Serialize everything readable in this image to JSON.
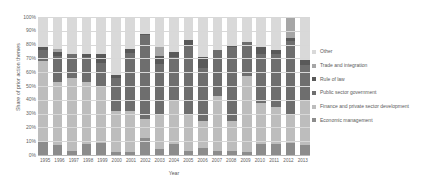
{
  "chart_data": {
    "type": "bar",
    "stacked": true,
    "normalized_percent": true,
    "title": "",
    "xlabel": "Year",
    "ylabel": "Share of prior action themes",
    "ylim": [
      0,
      100
    ],
    "ytick_labels": [
      "100%",
      "90%",
      "80%",
      "70%",
      "60%",
      "50%",
      "40%",
      "30%",
      "20%",
      "10%",
      "0%"
    ],
    "ytick_values": [
      100,
      90,
      80,
      70,
      60,
      50,
      40,
      30,
      20,
      10,
      0
    ],
    "grid": true,
    "legend_position": "right",
    "categories": [
      "1995",
      "1996",
      "1997",
      "1998",
      "1999",
      "2000",
      "2001",
      "2002",
      "2003",
      "2004",
      "2005",
      "2006",
      "2007",
      "2008",
      "2009",
      "2010",
      "2011",
      "2012",
      "2013"
    ],
    "series": [
      {
        "name": "Economic management",
        "color": "#8c8c8c",
        "values": [
          10,
          7,
          3,
          8,
          9,
          2,
          2,
          12,
          4,
          8,
          3,
          5,
          3,
          3,
          2,
          8,
          8,
          9,
          7
        ]
      },
      {
        "name": "Finance and private sector development",
        "color": "#bdbdbd",
        "values": [
          58,
          46,
          53,
          45,
          41,
          30,
          30,
          14,
          26,
          31,
          26,
          20,
          40,
          22,
          55,
          30,
          27,
          21,
          33
        ]
      },
      {
        "name": "Public sector government",
        "color": "#6e6e6e",
        "values": [
          8,
          19,
          17,
          18,
          17,
          24,
          42,
          61,
          36,
          32,
          50,
          38,
          33,
          53,
          25,
          35,
          38,
          53,
          25
        ]
      },
      {
        "name": "Rule of law",
        "color": "#595959",
        "values": [
          2,
          3,
          0,
          2,
          6,
          2,
          3,
          1,
          6,
          4,
          4,
          8,
          0,
          1,
          0,
          5,
          3,
          2,
          4
        ]
      },
      {
        "name": "Trade and integration",
        "color": "#a6a6a6",
        "values": [
          0,
          2,
          0,
          0,
          0,
          0,
          0,
          0,
          6,
          0,
          0,
          0,
          0,
          0,
          0,
          0,
          0,
          15,
          0
        ]
      },
      {
        "name": "Other",
        "color": "#d9d9d9",
        "values": [
          22,
          23,
          27,
          27,
          27,
          42,
          23,
          12,
          22,
          25,
          17,
          29,
          24,
          21,
          18,
          22,
          24,
          0,
          31
        ]
      }
    ],
    "legend_entries": [
      "Other",
      "Trade and integration",
      "Rule of law",
      "Public sector government",
      "Finance and private sector development",
      "Economic management"
    ]
  }
}
